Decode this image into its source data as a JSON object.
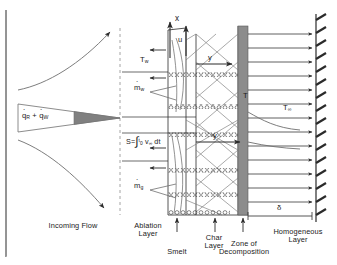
{
  "figure": {
    "canvas": {
      "width": 337,
      "height": 265
    },
    "colors": {
      "line": "#2b2b2b",
      "wedge_fill": "#808080",
      "decomposition_zone": "#8c8c8c",
      "background": "#ffffff",
      "dashed_divider": "#9a9a9a"
    }
  },
  "labels": {
    "heat_flux": {
      "q": "q",
      "sub_r": "R",
      "plus": "+",
      "sub_w": "W"
    },
    "heat_flux_text": "qR + qW",
    "x_axis": "x",
    "y_axis": "y",
    "y_axis_lower": "y",
    "velocity": "u",
    "wall_temp": {
      "base": "T",
      "sub": "w"
    },
    "temp_interface": "T",
    "free_temp": {
      "base": "T",
      "sub": "∞"
    },
    "mass_flux_water": {
      "base": "m",
      "sub": "w"
    },
    "mass_flux_gas": {
      "base": "m",
      "sub": "g"
    },
    "delta": "δ",
    "recession_formula": {
      "lhs": "S=",
      "integral": "∫",
      "lower_limit": "0",
      "upper_limit": "t",
      "integrand": "v",
      "integrand_sub": "∞",
      "differential": "dt",
      "full": "S = ∫₀ᵗ v∞ dt"
    }
  },
  "region_captions": [
    {
      "id": "incoming-flow",
      "text": "Incoming Flow",
      "lines": [
        "Incoming Flow"
      ]
    },
    {
      "id": "ablation-layer",
      "text": "Ablation Layer",
      "lines": [
        "Ablation",
        "Layer"
      ]
    },
    {
      "id": "smelt",
      "text": "Smelt",
      "lines": [
        "Smelt"
      ]
    },
    {
      "id": "char-layer",
      "text": "Char Layer",
      "lines": [
        "Char",
        "Layer"
      ]
    },
    {
      "id": "zone-of-decomposition",
      "text": "Zone of Decomposition",
      "lines": [
        "Zone of",
        "Decomposition"
      ]
    },
    {
      "id": "homogeneous-layer",
      "text": "Homogeneous Layer",
      "lines": [
        "Homogeneous",
        "Layer"
      ]
    }
  ]
}
